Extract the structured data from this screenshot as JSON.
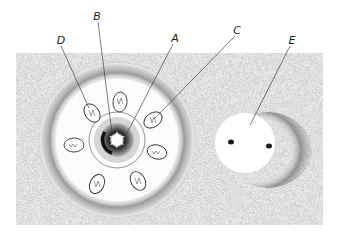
{
  "figure": {
    "labels": [
      {
        "id": "A",
        "text": "A",
        "x": 175,
        "y": 38
      },
      {
        "id": "B",
        "text": "B",
        "x": 97,
        "y": 16
      },
      {
        "id": "C",
        "text": "C",
        "x": 237,
        "y": 30
      },
      {
        "id": "D",
        "text": "D",
        "x": 61,
        "y": 40
      },
      {
        "id": "E",
        "text": "E",
        "x": 292,
        "y": 40
      }
    ],
    "colors": {
      "background_stipple": "#ececec",
      "ring_shade": "#8a8a8a",
      "line": "#444444",
      "nucleus": "#1a1a1a"
    }
  }
}
